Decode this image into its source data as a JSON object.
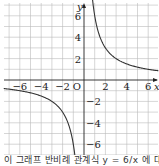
{
  "chart_data": {
    "type": "line",
    "title": "",
    "function": "y = 6/x",
    "xlabel": "x",
    "ylabel": "y",
    "origin_label": "O",
    "x_ticks": [
      -6,
      -4,
      -2,
      2,
      4,
      6
    ],
    "y_ticks": [
      6,
      4,
      2,
      -2,
      -4,
      -6
    ],
    "xlim": [
      -7.5,
      7
    ],
    "ylim": [
      -7,
      7.5
    ],
    "grid": true,
    "series": [
      {
        "name": "branch-positive",
        "x": [
          0.8,
          1,
          1.5,
          2,
          3,
          4,
          5,
          6,
          7
        ],
        "y": [
          7.5,
          6,
          4,
          3,
          2,
          1.5,
          1.2,
          1,
          0.86
        ]
      },
      {
        "name": "branch-negative",
        "x": [
          -7.5,
          -7,
          -6,
          -5,
          -4,
          -3,
          -2,
          -1.5,
          -1,
          -0.86
        ],
        "y": [
          -0.8,
          -0.86,
          -1,
          -1.2,
          -1.5,
          -2,
          -3,
          -4,
          -6,
          -7
        ]
      }
    ],
    "colors": {
      "curve": "#333333",
      "grid": "#bbbbbb",
      "axis": "#222222"
    }
  },
  "caption": "이 그래프 반비례 관계식 y = 6/x 에 대한 그래프"
}
